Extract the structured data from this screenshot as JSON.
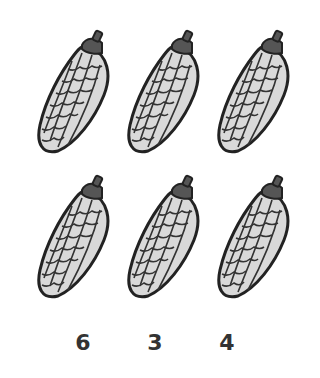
{
  "worksheet": {
    "task": "count the corn",
    "items": [
      {
        "name": "corn",
        "row": 1,
        "col": 1
      },
      {
        "name": "corn",
        "row": 1,
        "col": 2
      },
      {
        "name": "corn",
        "row": 1,
        "col": 3
      },
      {
        "name": "corn",
        "row": 2,
        "col": 1
      },
      {
        "name": "corn",
        "row": 2,
        "col": 2
      },
      {
        "name": "corn",
        "row": 2,
        "col": 3
      }
    ],
    "choices": [
      "6",
      "3",
      "4"
    ]
  },
  "colors": {
    "kernel": "#d9d9d9",
    "outline": "#222222",
    "cap": "#555555"
  }
}
